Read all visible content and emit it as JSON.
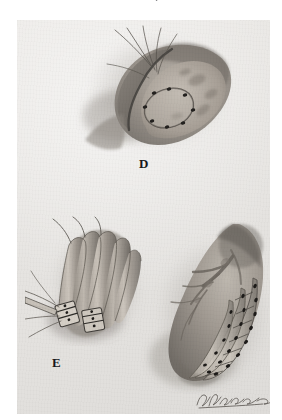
{
  "page": {
    "kind": "medical-surgical-illustration-plate",
    "background_color": "#ffffff",
    "plate_color": "#e7e5e2",
    "ink_color": "#3b3a38",
    "medium": "graphite pencil / wash, grayscale"
  },
  "caption": {
    "top_cutoff_text": "cut-off line of caption text"
  },
  "panels": [
    {
      "id": "D",
      "label": "D",
      "description": "Cross-sectioned pouch-like anatomical structure opened to expose an oval ring of interrupted suture points on the inner wall; fine suture strands trail from the upper-left margin.",
      "features": [
        "opened tissue flap with shaded raised rim",
        "oval ring of dark interrupted suture dots",
        "trailing suture threads at upper left",
        "soft graphite shading on surrounding tissue"
      ]
    },
    {
      "id": "E",
      "label": "E",
      "description": "Several elongated parallel tubular strips (graft/tendon bundles) gathered together and secured at their lower ends by clamped suture tags; long suture threads extend to the left.",
      "features": [
        "four to five parallel tubular strips",
        "banded suture ties at lower ends",
        "long trailing suture strands to the left",
        "shaded tissue bed behind the strips"
      ]
    },
    {
      "id": "F",
      "label": "F",
      "description": "Larger kidney-shaped organ segment with a branching vascular pedicle entering at the upper pole; the lower margin carries ladder-like banded strips studded with dark interrupted suture points.",
      "features": [
        "branching vascular pedicle at upper pole",
        "ladder-like parallel banded strips along the lower curve",
        "rows of dark interrupted suture dots",
        "soft gradient shading over the organ body"
      ]
    }
  ],
  "signature": {
    "present": true,
    "style": "cursive artist signature",
    "location": "lower right of panel F"
  }
}
